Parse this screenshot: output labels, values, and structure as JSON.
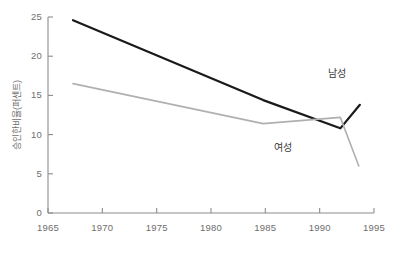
{
  "chart_data": {
    "type": "line",
    "title": "",
    "subtitle": "",
    "xlabel": "",
    "ylabel": "승인한비율(퍼센트)",
    "xlim": [
      1965,
      1995
    ],
    "ylim": [
      0,
      25
    ],
    "xticks": [
      1965,
      1970,
      1975,
      1980,
      1985,
      1990,
      1995
    ],
    "yticks": [
      0,
      5,
      10,
      15,
      20,
      25
    ],
    "xtick_labels": [
      "1965",
      "1970",
      "1975",
      "1980",
      "1985",
      "1990",
      "1995"
    ],
    "ytick_labels": [
      "0",
      "5",
      "10",
      "15",
      "20",
      "25"
    ],
    "grid": false,
    "legend_position": "inline-annotation",
    "series": [
      {
        "name": "남성",
        "color": "#1a1a1a",
        "width": 2.2,
        "x": [
          1967.3,
          1984.8,
          1991.9,
          1993.7
        ],
        "values": [
          24.6,
          14.4,
          10.8,
          13.8
        ]
      },
      {
        "name": "여성",
        "color": "#b0b0b0",
        "width": 1.6,
        "x": [
          1967.3,
          1984.8,
          1991.9,
          1993.6
        ],
        "values": [
          16.5,
          11.4,
          12.2,
          6.0
        ]
      }
    ],
    "annotations": [
      {
        "text": "남성",
        "x": 1993.0,
        "y": 18.0,
        "align": "right"
      },
      {
        "text": "여성",
        "x": 1986.6,
        "y": 8.6,
        "align": "center"
      }
    ],
    "colors": {
      "axis": "#8c8c8c",
      "tick_text": "#6e6e6e",
      "background": "#ffffff",
      "male_series": "#1a1a1a",
      "female_series": "#b0b0b0"
    }
  }
}
